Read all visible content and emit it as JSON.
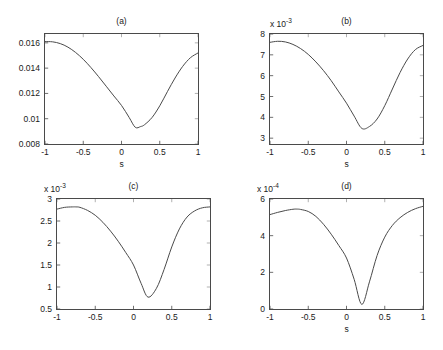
{
  "figure": {
    "background": "#ffffff",
    "line_color": "#4a4a4a",
    "axis_color": "#4a4a4a",
    "text_color": "#1a1a1a"
  },
  "chart_data": [
    {
      "type": "line",
      "title": "(a)",
      "xlabel": "s",
      "ylabel": "",
      "multiplier": "",
      "xlim": [
        -1,
        1
      ],
      "ylim": [
        0.008,
        0.0167
      ],
      "xticks": [
        -1,
        -0.5,
        0,
        0.5,
        1
      ],
      "xticklabels": [
        "-1",
        "-0.5",
        "0",
        "0.5",
        "1"
      ],
      "yticks": [
        0.008,
        0.01,
        0.012,
        0.014,
        0.016
      ],
      "yticklabels": [
        "0.008",
        "0.01",
        "0.012",
        "0.014",
        "0.016"
      ],
      "grid": false,
      "legend": null,
      "x": [
        -1,
        -0.9,
        -0.8,
        -0.7,
        -0.6,
        -0.5,
        -0.4,
        -0.3,
        -0.2,
        -0.1,
        0,
        0.1,
        0.18,
        0.25,
        0.3,
        0.4,
        0.5,
        0.6,
        0.7,
        0.8,
        0.9,
        1
      ],
      "values": [
        0.0161,
        0.01608,
        0.01594,
        0.01566,
        0.01524,
        0.0147,
        0.01405,
        0.01333,
        0.01257,
        0.0118,
        0.01105,
        0.0101,
        0.00932,
        0.00938,
        0.00952,
        0.0101,
        0.01102,
        0.01214,
        0.01322,
        0.01414,
        0.01482,
        0.0152
      ]
    },
    {
      "type": "line",
      "title": "(b)",
      "xlabel": "s",
      "ylabel": "",
      "multiplier": "x 10^-3",
      "multiplier_base": "x 10",
      "multiplier_exp": "-3",
      "xlim": [
        -1,
        1
      ],
      "ylim": [
        2.72,
        8
      ],
      "xticks": [
        -1,
        -0.5,
        0,
        0.5,
        1
      ],
      "xticklabels": [
        "-1",
        "-0.5",
        "0",
        "0.5",
        "1"
      ],
      "yticks": [
        3,
        4,
        5,
        6,
        7,
        8
      ],
      "yticklabels": [
        "3",
        "4",
        "5",
        "6",
        "7",
        "8"
      ],
      "grid": false,
      "legend": null,
      "x": [
        -1,
        -0.9,
        -0.8,
        -0.7,
        -0.6,
        -0.5,
        -0.4,
        -0.3,
        -0.2,
        -0.1,
        0,
        0.1,
        0.2,
        0.3,
        0.4,
        0.5,
        0.6,
        0.7,
        0.8,
        0.9,
        1
      ],
      "values": [
        7.6,
        7.65,
        7.62,
        7.5,
        7.3,
        7.02,
        6.66,
        6.24,
        5.76,
        5.22,
        4.68,
        4.06,
        3.47,
        3.56,
        3.92,
        4.56,
        5.36,
        6.15,
        6.8,
        7.25,
        7.45
      ]
    },
    {
      "type": "line",
      "title": "(c)",
      "xlabel": "",
      "ylabel": "",
      "multiplier": "x 10^-3",
      "multiplier_base": "x 10",
      "multiplier_exp": "-3",
      "xlim": [
        -1,
        1
      ],
      "ylim": [
        0.5,
        3
      ],
      "xticks": [
        -1,
        -0.5,
        0,
        0.5,
        1
      ],
      "xticklabels": [
        "-1",
        "-0.5",
        "0",
        "0.5",
        "1"
      ],
      "yticks": [
        0.5,
        1,
        1.5,
        2,
        2.5,
        3
      ],
      "yticklabels": [
        "0.5",
        "1",
        "1.5",
        "2",
        "2.5",
        "3"
      ],
      "grid": false,
      "legend": null,
      "x": [
        -1,
        -0.9,
        -0.8,
        -0.75,
        -0.7,
        -0.6,
        -0.5,
        -0.4,
        -0.3,
        -0.2,
        -0.1,
        0,
        0.1,
        0.19,
        0.3,
        0.4,
        0.5,
        0.6,
        0.7,
        0.8,
        0.9,
        1
      ],
      "values": [
        2.77,
        2.81,
        2.82,
        2.82,
        2.81,
        2.74,
        2.63,
        2.47,
        2.27,
        2.04,
        1.78,
        1.5,
        1.08,
        0.77,
        0.97,
        1.4,
        1.91,
        2.32,
        2.59,
        2.73,
        2.8,
        2.82
      ]
    },
    {
      "type": "line",
      "title": "(d)",
      "xlabel": "s",
      "ylabel": "",
      "multiplier": "x 10^-4",
      "multiplier_base": "x 10",
      "multiplier_exp": "-4",
      "xlim": [
        -1,
        1
      ],
      "ylim": [
        0,
        6
      ],
      "xticks": [
        -1,
        -0.5,
        0,
        0.5,
        1
      ],
      "xticklabels": [
        "-1",
        "-0.5",
        "0",
        "0.5",
        "1"
      ],
      "yticks": [
        0,
        2,
        4,
        6
      ],
      "yticklabels": [
        "0",
        "2",
        "4",
        "6"
      ],
      "grid": false,
      "legend": null,
      "x": [
        -1,
        -0.9,
        -0.8,
        -0.7,
        -0.65,
        -0.6,
        -0.5,
        -0.4,
        -0.3,
        -0.2,
        -0.1,
        0,
        0.1,
        0.2,
        0.3,
        0.4,
        0.5,
        0.6,
        0.7,
        0.8,
        0.9,
        1
      ],
      "values": [
        5.15,
        5.27,
        5.37,
        5.44,
        5.45,
        5.43,
        5.32,
        5.05,
        4.62,
        4.08,
        3.46,
        2.78,
        1.62,
        0.25,
        1.48,
        2.92,
        3.92,
        4.56,
        4.98,
        5.27,
        5.47,
        5.6
      ]
    }
  ]
}
